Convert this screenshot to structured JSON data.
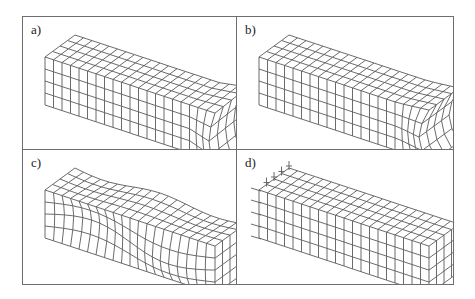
{
  "figure": {
    "panels": [
      {
        "id": "a",
        "label": "a)",
        "deformation": "end-distortion"
      },
      {
        "id": "b",
        "label": "b)",
        "deformation": "end-necking"
      },
      {
        "id": "c",
        "label": "c)",
        "deformation": "wavy-buckling"
      },
      {
        "id": "d",
        "label": "d)",
        "deformation": "undeformed-with-supports"
      }
    ],
    "mesh": {
      "length_cells": 20,
      "height_cells": 4,
      "depth_cells": 4
    },
    "colors": {
      "line": "#5a5a5a",
      "frame": "#6e6e6e",
      "background": "#ffffff"
    }
  }
}
